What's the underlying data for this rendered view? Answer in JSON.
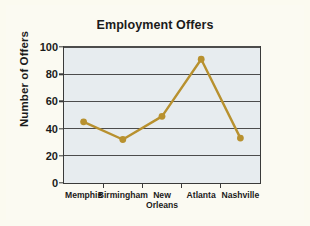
{
  "chart_data": {
    "type": "line",
    "title": "Employment Offers",
    "xlabel": "",
    "ylabel": "Number of Offers",
    "categories": [
      "Memphis",
      "Birmingham",
      "New\nOrleans",
      "Atlanta",
      "Nashville"
    ],
    "values": [
      45,
      32,
      49,
      91,
      33
    ],
    "ylim": [
      0,
      100
    ],
    "yticks": [
      0,
      20,
      40,
      60,
      80,
      100
    ],
    "ytick_labels": [
      "0",
      "20",
      "40",
      "60",
      "80",
      "100"
    ],
    "grid": true,
    "legend": false,
    "series_color": "#b8912f",
    "marker": "circle",
    "plot_background": "#e7ecef",
    "figure_background": "#fbfaf2",
    "axis_color": "#3a3a3a"
  }
}
